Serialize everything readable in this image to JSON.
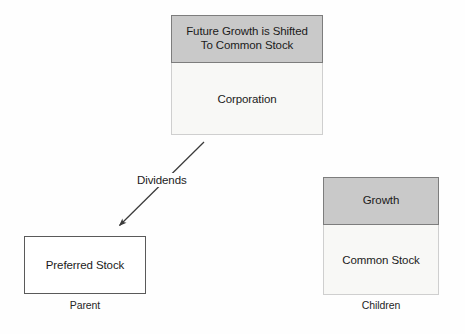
{
  "diagram": {
    "colors": {
      "header_fill": "#c9c9c9",
      "header_stroke": "#7d7d7d",
      "body_fill": "#f8f8f6",
      "body_stroke": "#cfcfcf",
      "plain_stroke": "#5a5a5a",
      "arrow_stroke": "#3a3a3a",
      "background": "#fefefe",
      "text": "#1b1b1b"
    },
    "nodes": {
      "corporation": {
        "header_line1": "Future Growth is Shifted",
        "header_line2": "To Common Stock",
        "body_label": "Corporation"
      },
      "children": {
        "header_label": "Growth",
        "body_label": "Common Stock"
      },
      "parent": {
        "body_label": "Preferred Stock"
      }
    },
    "captions": {
      "parent": "Parent",
      "children": "Children"
    },
    "edges": [
      {
        "id": "dividends-edge",
        "label": "Dividends",
        "from": "corporation",
        "to": "parent",
        "style": "solid-arrow",
        "start": {
          "x": 204,
          "y": 142
        },
        "end": {
          "x": 116,
          "y": 228
        }
      }
    ]
  }
}
